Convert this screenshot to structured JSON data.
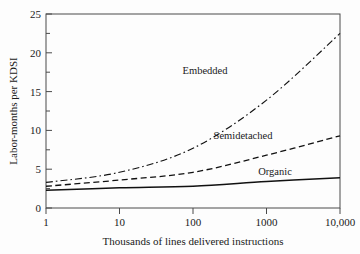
{
  "chart_data": {
    "type": "line",
    "title": "",
    "xlabel": "Thousands of lines delivered instructions",
    "ylabel": "Labor-months per KDSI",
    "xscale": "log",
    "xlim": [
      1,
      10000
    ],
    "ylim": [
      0,
      25
    ],
    "xticks": [
      1,
      10,
      100,
      1000,
      10000
    ],
    "xtick_labels": [
      "1",
      "10",
      "100",
      "1000",
      "10,000"
    ],
    "yticks": [
      0,
      5,
      10,
      15,
      20,
      25
    ],
    "ytick_labels": [
      "0",
      "5",
      "10",
      "15",
      "20",
      "25"
    ],
    "yminor_ticks": [
      2.5,
      7.5,
      12.5,
      17.5,
      22.5
    ],
    "grid": false,
    "legend_position": "inline-annotations",
    "x": [
      1,
      10,
      100,
      1000,
      10000
    ],
    "series": [
      {
        "name": "Embedded",
        "label": "Embedded",
        "style": "dash-dot",
        "color": "#111111",
        "values": [
          3.3,
          4.6,
          7.7,
          13.9,
          22.5
        ],
        "label_x": 205,
        "label_y": 74
      },
      {
        "name": "Semidetached",
        "label": "Semidetached",
        "style": "dashed",
        "color": "#111111",
        "values": [
          2.8,
          3.6,
          4.6,
          6.8,
          9.3
        ],
        "label_x": 243,
        "label_y": 139
      },
      {
        "name": "Organic",
        "label": "Organic",
        "style": "solid",
        "color": "#111111",
        "values": [
          2.3,
          2.6,
          2.8,
          3.4,
          3.9
        ],
        "label_x": 275,
        "label_y": 175
      }
    ]
  },
  "colors": {
    "background": "#fdfdfd",
    "axis": "#4a4a4a",
    "ink": "#111111"
  }
}
